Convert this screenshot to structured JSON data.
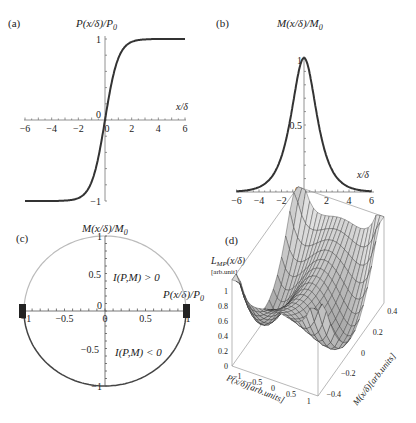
{
  "panels": {
    "a": {
      "label": "(a)",
      "ylabel": "P(x/δ)/P",
      "ylabel_sub": "0",
      "xlabel": "x/δ",
      "xticks": [
        "-6",
        "-4",
        "-2",
        "0",
        "2",
        "4",
        "6"
      ],
      "yticks": [
        "1",
        "0",
        "-1"
      ]
    },
    "b": {
      "label": "(b)",
      "ylabel": "M(x/δ)/M",
      "ylabel_sub": "0",
      "xlabel": "x/δ",
      "xticks": [
        "-6",
        "-4",
        "-2",
        "0",
        "2",
        "4",
        "6"
      ],
      "yticks": [
        "1",
        "0.5",
        "0"
      ]
    },
    "c": {
      "label": "(c)",
      "ylabel": "M(x/δ)/M",
      "ylabel_sub": "0",
      "xlabel": "P(x/δ)/P",
      "xlabel_sub": "0",
      "upper_region": "I(P,M) > 0",
      "lower_region": "I(P,M) < 0",
      "xticks": [
        "-1",
        "-0.5",
        "0",
        "0.5",
        "1"
      ],
      "yticks": [
        "1",
        "0.5",
        "0",
        "-0.5",
        "-1"
      ]
    },
    "d": {
      "label": "(d)",
      "zlabel": "L",
      "zlabel_sub": "MP",
      "zlabel_rest": "(x/δ)",
      "zunit": "[arb.unit]",
      "xlabel": "P(x/δ)[arb.units]",
      "ylabel": "M(x/δ)[arb.units]",
      "zticks": [
        "1",
        "0.8",
        "0.6",
        "0.4",
        "0.2",
        "0"
      ],
      "xticks": [
        "-1",
        "-0.5",
        "0",
        "0.5",
        "1"
      ],
      "yticks": [
        "0.4",
        "0.2",
        "0",
        "-0.2",
        "-0.4"
      ]
    }
  },
  "chart_data": [
    {
      "type": "line",
      "title": "(a)",
      "xlabel": "x/δ",
      "ylabel": "P(x/δ)/P0",
      "function": "tanh(x)",
      "xlim": [
        -6,
        6
      ],
      "ylim": [
        -1,
        1
      ],
      "x": [
        -6,
        -4,
        -3,
        -2,
        -1.5,
        -1,
        -0.5,
        0,
        0.5,
        1,
        1.5,
        2,
        3,
        4,
        6
      ],
      "y": [
        -1.0,
        -0.999,
        -0.995,
        -0.964,
        -0.905,
        -0.762,
        -0.462,
        0,
        0.462,
        0.762,
        0.905,
        0.964,
        0.995,
        0.999,
        1.0
      ]
    },
    {
      "type": "line",
      "title": "(b)",
      "xlabel": "x/δ",
      "ylabel": "M(x/δ)/M0",
      "function": "sech(x)",
      "xlim": [
        -6,
        6
      ],
      "ylim": [
        0,
        1
      ],
      "x": [
        -6,
        -4,
        -3,
        -2,
        -1.5,
        -1,
        -0.5,
        0,
        0.5,
        1,
        1.5,
        2,
        3,
        4,
        6
      ],
      "y": [
        0.005,
        0.037,
        0.099,
        0.266,
        0.425,
        0.648,
        0.887,
        1.0,
        0.887,
        0.648,
        0.425,
        0.266,
        0.099,
        0.037,
        0.005
      ]
    },
    {
      "type": "line",
      "title": "(c)",
      "xlabel": "P(x/δ)/P0",
      "ylabel": "M(x/δ)/M0",
      "description": "unit circle P^2 + M^2 = 1; upper half I(P,M) > 0 (light), lower half I(P,M) < 0 (dark)",
      "xlim": [
        -1,
        1
      ],
      "ylim": [
        -1,
        1
      ],
      "annotations": [
        "I(P,M) > 0",
        "I(P,M) < 0"
      ]
    },
    {
      "type": "surface",
      "title": "(d)",
      "xlabel": "P(x/δ)[arb.units]",
      "ylabel": "M(x/δ)[arb.units]",
      "zlabel": "L_MP(x/δ) [arb.unit]",
      "xlim": [
        -1,
        1
      ],
      "ylim": [
        -0.4,
        0.4
      ],
      "zlim": [
        0,
        1
      ],
      "description": "double-well surface with minima near P = ±1, M = 0 and a saddle at origin"
    }
  ]
}
